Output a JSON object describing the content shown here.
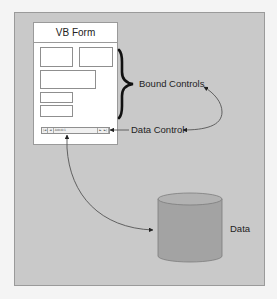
{
  "diagram": {
    "form": {
      "title": "VB Form",
      "textboxes": [
        {
          "id": "box1",
          "x": 7,
          "y": 25,
          "w": 32,
          "h": 19
        },
        {
          "id": "box2",
          "x": 46,
          "y": 25,
          "w": 33,
          "h": 19
        },
        {
          "id": "box3",
          "x": 7,
          "y": 48,
          "w": 55,
          "h": 18
        },
        {
          "id": "box4",
          "x": 7,
          "y": 70,
          "w": 32,
          "h": 10
        },
        {
          "id": "box5",
          "x": 7,
          "y": 83,
          "w": 32,
          "h": 11
        }
      ],
      "data_control": {
        "first": "|◄",
        "prev": "◄",
        "caption": "Adodc1",
        "next": "►",
        "last": "►|"
      }
    },
    "labels": {
      "bound_controls": "Bound Controls",
      "data_control": "Data Control",
      "data": "Data"
    },
    "colors": {
      "page_background": "#f4f4f4",
      "panel_background": "#c9c9c9",
      "panel_border": "#9a9a9a",
      "form_background": "#ffffff",
      "cylinder_fill": "#a3a3a3",
      "cylinder_top": "#b2b2b2",
      "connector": "#555555",
      "brace": "#111111"
    },
    "connectors": [
      {
        "from": "data_control_label",
        "to": "data_control_widget",
        "style": "straight-arrow"
      },
      {
        "from": "data_control_label",
        "to": "bound_controls_label",
        "style": "curved-arrow"
      },
      {
        "from": "data_control_widget",
        "to": "data_store",
        "style": "curved-bidirectional-arrow"
      }
    ]
  }
}
